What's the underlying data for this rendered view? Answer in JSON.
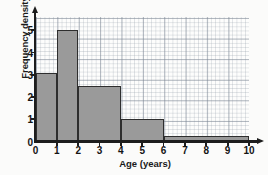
{
  "chart_data": {
    "type": "bar",
    "title": "",
    "subtitle": "",
    "xlabel": "Age (years)",
    "ylabel": "Frequency density",
    "xlim": [
      0,
      10
    ],
    "ylim": [
      0,
      5.6
    ],
    "grid": true,
    "legend": "none",
    "xticks": [
      0,
      1,
      2,
      3,
      4,
      5,
      6,
      7,
      8,
      9,
      10
    ],
    "yticks": [
      0,
      1,
      2,
      3,
      4,
      5
    ],
    "xtick_labels": [
      "0",
      "1",
      "2",
      "3",
      "4",
      "5",
      "6",
      "7",
      "8",
      "9",
      "10"
    ],
    "ytick_labels": [
      "0",
      "1",
      "2",
      "3",
      "4",
      "5"
    ],
    "bin_edges": [
      0,
      1,
      2,
      4,
      6,
      10
    ],
    "values": [
      3.1,
      5.0,
      2.5,
      1.0,
      0.25
    ],
    "bars": [
      {
        "x0": 0,
        "x1": 1,
        "height": 3.1,
        "label": "0-1"
      },
      {
        "x0": 1,
        "x1": 2,
        "height": 5.0,
        "label": "1-2"
      },
      {
        "x0": 2,
        "x1": 4,
        "height": 2.5,
        "label": "2-4"
      },
      {
        "x0": 4,
        "x1": 6,
        "height": 1.0,
        "label": "4-6"
      },
      {
        "x0": 6,
        "x1": 10,
        "height": 0.25,
        "label": "6-10"
      }
    ],
    "colors": {
      "bar_fill": "#9a9a9a",
      "bar_edge": "#2e2e2e",
      "axis": "#1d1d1d",
      "grid_minor": "#96a0ac",
      "grid_major": "#788291",
      "background": "#fdfdfc"
    }
  }
}
